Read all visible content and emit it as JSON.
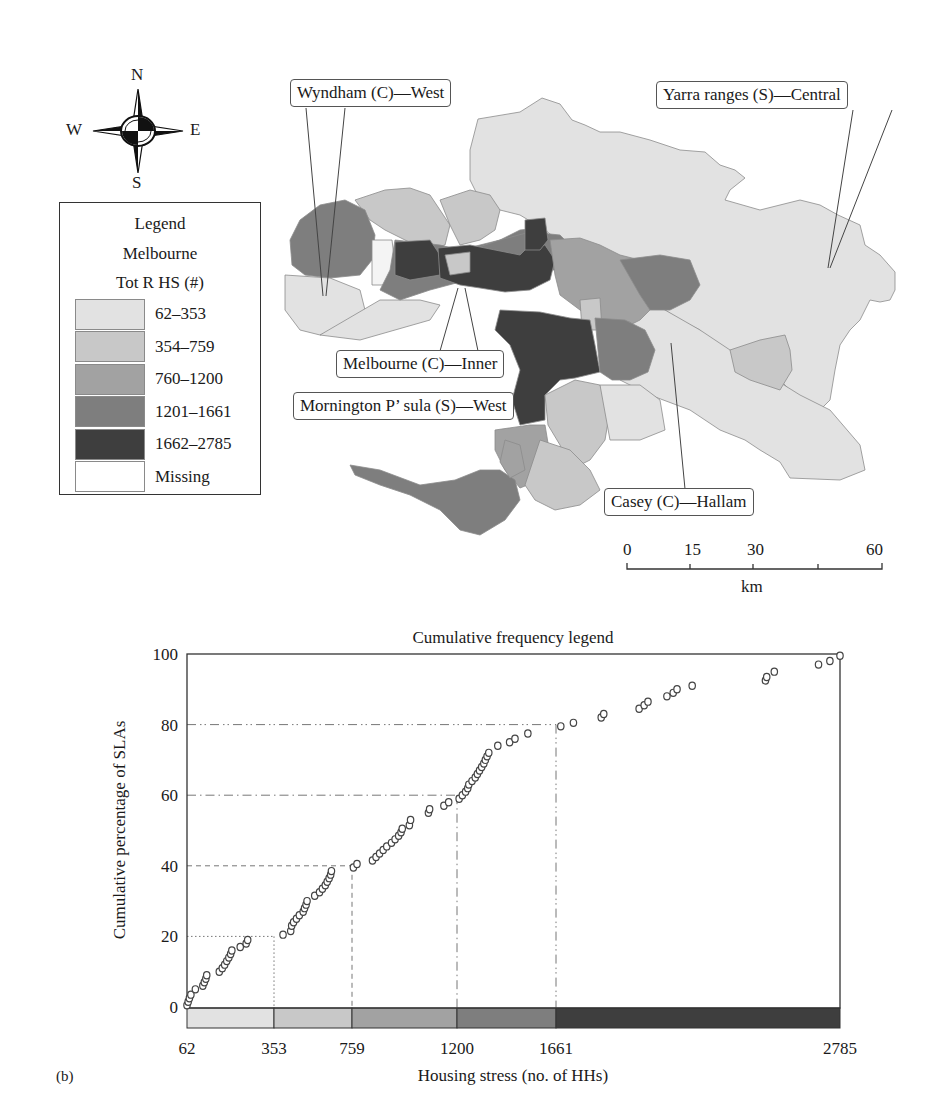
{
  "map": {
    "compass": {
      "n": "N",
      "s": "S",
      "e": "E",
      "w": "W"
    },
    "legend": {
      "title": "Legend",
      "subtitle": "Melbourne",
      "variable": "Tot R HS (#)",
      "classes": [
        {
          "label": "62–353",
          "color": "#e2e2e2"
        },
        {
          "label": "354–759",
          "color": "#c8c8c8"
        },
        {
          "label": "760–1200",
          "color": "#a2a2a2"
        },
        {
          "label": "1201–1661",
          "color": "#7e7e7e"
        },
        {
          "label": "1662–2785",
          "color": "#3e3e3e"
        },
        {
          "label": "Missing",
          "color": "#ffffff"
        }
      ]
    },
    "callouts": {
      "wyndham": "Wyndham (C)—West",
      "yarra": "Yarra ranges (S)—Central",
      "melbourne": "Melbourne (C)—Inner",
      "mornington": "Mornington P’ sula (S)—West",
      "casey": "Casey (C)—Hallam"
    },
    "scale_bar": {
      "ticks": [
        "0",
        "15",
        "30",
        "60"
      ],
      "unit": "km"
    }
  },
  "panel_label": "(b)",
  "chart_data": {
    "type": "scatter",
    "title": "Cumulative frequency legend",
    "xlabel": "Housing stress (no. of HHs)",
    "ylabel": "Cumulative percentage of SLAs",
    "ylim": [
      0,
      100
    ],
    "xlim": [
      62,
      2785
    ],
    "y_ticks": [
      0,
      20,
      40,
      60,
      80,
      100
    ],
    "x_ticks": [
      62,
      353,
      759,
      1200,
      1661,
      2785
    ],
    "x_scale": "piecewise by class breaks (non-linear)",
    "class_breaks": [
      62,
      353,
      759,
      1200,
      1661,
      2785
    ],
    "class_colors": [
      "#e2e2e2",
      "#c8c8c8",
      "#a2a2a2",
      "#7e7e7e",
      "#3e3e3e"
    ],
    "reference_lines": [
      {
        "x": 353,
        "y": 20,
        "style": "dotted"
      },
      {
        "x": 759,
        "y": 40,
        "style": "dashed"
      },
      {
        "x": 1200,
        "y": 60,
        "style": "dash-dot"
      },
      {
        "x": 1661,
        "y": 80,
        "style": "dash-dot-dot"
      }
    ],
    "grid": false,
    "legend_position": "none",
    "series": [
      {
        "name": "SLAs",
        "marker": "open-circle",
        "points": [
          [
            62,
            0.5
          ],
          [
            66,
            1.5
          ],
          [
            70,
            2.5
          ],
          [
            75,
            3.5
          ],
          [
            90,
            5
          ],
          [
            115,
            6
          ],
          [
            120,
            7
          ],
          [
            125,
            8
          ],
          [
            128,
            9
          ],
          [
            170,
            10
          ],
          [
            180,
            11
          ],
          [
            188,
            12
          ],
          [
            195,
            13
          ],
          [
            202,
            14
          ],
          [
            208,
            15
          ],
          [
            212,
            16
          ],
          [
            240,
            17
          ],
          [
            260,
            18
          ],
          [
            265,
            19
          ],
          [
            400,
            20.5
          ],
          [
            440,
            21.5
          ],
          [
            445,
            23
          ],
          [
            455,
            24
          ],
          [
            470,
            25
          ],
          [
            485,
            26
          ],
          [
            505,
            27
          ],
          [
            512,
            28
          ],
          [
            520,
            29
          ],
          [
            525,
            30
          ],
          [
            565,
            31.5
          ],
          [
            590,
            32.5
          ],
          [
            605,
            33.5
          ],
          [
            620,
            34.5
          ],
          [
            630,
            35.5
          ],
          [
            640,
            36.5
          ],
          [
            648,
            37.5
          ],
          [
            652,
            38.5
          ],
          [
            765,
            39.5
          ],
          [
            780,
            40.5
          ],
          [
            845,
            41.5
          ],
          [
            860,
            42.5
          ],
          [
            875,
            43.5
          ],
          [
            890,
            44.5
          ],
          [
            905,
            45.5
          ],
          [
            925,
            46.5
          ],
          [
            940,
            47.5
          ],
          [
            955,
            48.5
          ],
          [
            965,
            49.5
          ],
          [
            970,
            50.5
          ],
          [
            1000,
            51.5
          ],
          [
            1005,
            53
          ],
          [
            1080,
            55
          ],
          [
            1085,
            56
          ],
          [
            1145,
            57
          ],
          [
            1165,
            58
          ],
          [
            1210,
            59
          ],
          [
            1225,
            60
          ],
          [
            1240,
            61
          ],
          [
            1250,
            62
          ],
          [
            1255,
            63
          ],
          [
            1270,
            64
          ],
          [
            1285,
            65
          ],
          [
            1295,
            66
          ],
          [
            1305,
            67
          ],
          [
            1315,
            68
          ],
          [
            1325,
            69
          ],
          [
            1332,
            70
          ],
          [
            1340,
            71
          ],
          [
            1348,
            72
          ],
          [
            1390,
            74
          ],
          [
            1445,
            75
          ],
          [
            1470,
            76
          ],
          [
            1530,
            77.5
          ],
          [
            1680,
            79.5
          ],
          [
            1730,
            80.5
          ],
          [
            1840,
            82
          ],
          [
            1850,
            83
          ],
          [
            1990,
            84.5
          ],
          [
            2010,
            85.5
          ],
          [
            2025,
            86.5
          ],
          [
            2100,
            88
          ],
          [
            2125,
            89
          ],
          [
            2140,
            90
          ],
          [
            2200,
            91
          ],
          [
            2490,
            92.5
          ],
          [
            2495,
            93.5
          ],
          [
            2525,
            95
          ],
          [
            2700,
            97
          ],
          [
            2745,
            98
          ],
          [
            2785,
            99.5
          ]
        ]
      }
    ]
  }
}
